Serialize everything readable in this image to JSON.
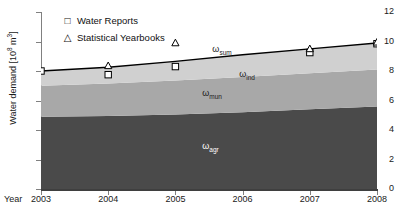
{
  "chart_data": {
    "type": "area",
    "title": "",
    "xlabel": "Year",
    "ylabel": "Water demand [10⁸ m³]",
    "ylabel_text": "Water demand [10",
    "ylabel_exp": "8",
    "ylabel_tail": " m",
    "ylabel_exp2": "3",
    "ylabel_close": "]",
    "xlim": [
      2003,
      2008
    ],
    "ylim": [
      0,
      12
    ],
    "grid": false,
    "x": [
      2003,
      2004,
      2005,
      2006,
      2007,
      2008
    ],
    "xtick_labels": [
      "2003",
      "2004",
      "2005",
      "2006",
      "2007",
      "2008"
    ],
    "ytick_values": [
      0,
      2,
      4,
      6,
      8,
      10,
      12
    ],
    "ytick_labels": [
      "0",
      "2",
      "4",
      "6",
      "8",
      "10",
      "12"
    ],
    "stacked_series": [
      {
        "name": "ω_agr",
        "label": "ω",
        "sub": "agr",
        "color": "#4a4a4a",
        "values": [
          4.9,
          4.95,
          5.05,
          5.2,
          5.4,
          5.6
        ]
      },
      {
        "name": "ω_mun",
        "label": "ω",
        "sub": "mun",
        "color": "#a8a8a8",
        "values": [
          2.1,
          2.2,
          2.3,
          2.4,
          2.45,
          2.5
        ]
      },
      {
        "name": "ω_ind",
        "label": "ω",
        "sub": "ind",
        "color": "#d0d0d0",
        "values": [
          1.0,
          1.1,
          1.3,
          1.5,
          1.65,
          1.8
        ]
      }
    ],
    "sum_line": {
      "name": "ω_sum",
      "label": "ω",
      "sub": "sum",
      "color": "#000000",
      "values": [
        8.0,
        8.25,
        8.65,
        9.1,
        9.5,
        9.9
      ]
    },
    "markers": [
      {
        "name": "Water Reports",
        "symbol": "square",
        "x": [
          2003,
          2004,
          2005,
          2007,
          2008
        ],
        "y": [
          8.0,
          7.75,
          8.3,
          9.25,
          9.85
        ]
      },
      {
        "name": "Statistical Yearbooks",
        "symbol": "triangle",
        "x": [
          2004,
          2005,
          2007,
          2008
        ],
        "y": [
          8.35,
          9.9,
          9.5,
          9.95
        ]
      }
    ],
    "legend": {
      "position": "top-left",
      "entries": [
        {
          "symbol": "□",
          "label": "Water Reports"
        },
        {
          "symbol": "△",
          "label": "Statistical Yearbooks"
        }
      ]
    },
    "annotations": [
      {
        "text": "ω",
        "sub": "sum",
        "x": 2005.55,
        "y": 9.45,
        "color": "dark"
      },
      {
        "text": "ω",
        "sub": "ind",
        "x": 2005.95,
        "y": 7.75,
        "color": "dark"
      },
      {
        "text": "ω",
        "sub": "mun",
        "x": 2005.4,
        "y": 6.45,
        "color": "dark"
      },
      {
        "text": "ω",
        "sub": "agr",
        "x": 2005.4,
        "y": 2.85,
        "color": "light"
      }
    ]
  }
}
